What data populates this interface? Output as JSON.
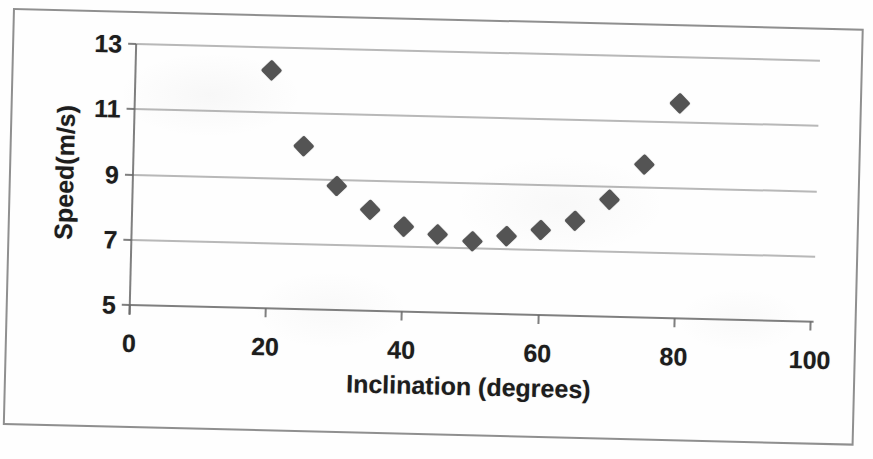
{
  "document": {
    "kind": "scanned-scatter-chart",
    "background_color": "#fefefe",
    "scan_tilt_degrees": 1.4
  },
  "theme": {
    "marker_color": "#545454",
    "grid_color": "#7d7d7d",
    "axis_color": "#696969",
    "text_color": "#1d1d1d",
    "frame_border_color": "#696969"
  },
  "chart_data": {
    "type": "scatter",
    "title": "",
    "xlabel": "Inclination (degrees)",
    "ylabel": "Speed(m/s)",
    "x": [
      20,
      25,
      30,
      35,
      40,
      45,
      50,
      55,
      60,
      65,
      70,
      75,
      80
    ],
    "y": [
      12.3,
      10.0,
      8.8,
      8.1,
      7.6,
      7.4,
      7.2,
      7.4,
      7.6,
      7.9,
      8.6,
      9.7,
      11.6
    ],
    "xlim": [
      0,
      100
    ],
    "ylim": [
      5,
      13
    ],
    "x_ticks": [
      0,
      20,
      40,
      60,
      80,
      100
    ],
    "y_ticks": [
      5,
      7,
      9,
      11,
      13
    ],
    "gridlines": "horizontal-only",
    "gridline_y_values": [
      7,
      9,
      11,
      13
    ],
    "marker_shape": "diamond",
    "legend": "none"
  }
}
